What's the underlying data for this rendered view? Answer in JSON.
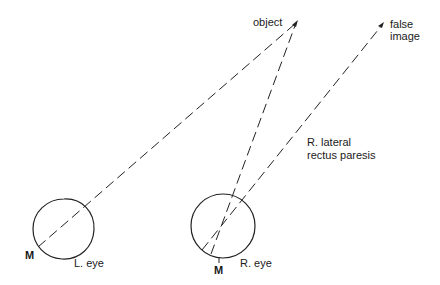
{
  "diagram": {
    "labels": {
      "object": "object",
      "false_image_line1": "false",
      "false_image_line2": "image",
      "paresis_line1": "R. lateral",
      "paresis_line2": "rectus paresis",
      "left_eye": "L. eye",
      "right_eye": "R. eye",
      "left_macula": "M",
      "right_macula": "M"
    },
    "colors": {
      "stroke": "#222222",
      "text": "#1a1a1a",
      "background": "#ffffff"
    }
  }
}
